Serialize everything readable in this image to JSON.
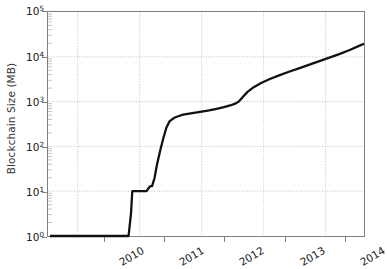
{
  "chart_data": {
    "type": "line",
    "title": "",
    "xlabel": "",
    "ylabel": "Blockchain Size (MB)",
    "yscale": "log",
    "ylim": [
      1,
      100000
    ],
    "xlim": [
      2009.52,
      2014.62
    ],
    "grid": true,
    "legend": false,
    "line_color": "#111111",
    "grid_color": "#bdbdbd",
    "axis_color": "#808080",
    "ytick_labels": [
      "10^0",
      "10^1",
      "10^2",
      "10^3",
      "10^4",
      "10^5"
    ],
    "ytick_bases": [
      "10",
      "10",
      "10",
      "10",
      "10",
      "10"
    ],
    "ytick_exponents": [
      "0",
      "1",
      "2",
      "3",
      "4",
      "5"
    ],
    "ytick_values": [
      1,
      10,
      100,
      1000,
      10000,
      100000
    ],
    "xtick_labels": [
      "2010",
      "2011",
      "2012",
      "2013",
      "2014"
    ],
    "xtick_values": [
      2010,
      2011,
      2012,
      2013,
      2014
    ],
    "series": [
      {
        "name": "Blockchain Size",
        "x": [
          2009.55,
          2010.82,
          2010.86,
          2010.88,
          2011.02,
          2011.08,
          2011.11,
          2011.14,
          2011.17,
          2011.2,
          2011.24,
          2011.28,
          2011.33,
          2011.38,
          2011.43,
          2011.48,
          2011.55,
          2011.62,
          2011.7,
          2011.8,
          2011.9,
          2012.0,
          2012.12,
          2012.24,
          2012.36,
          2012.46,
          2012.54,
          2012.6,
          2012.66,
          2012.74,
          2012.84,
          2012.96,
          2013.1,
          2013.26,
          2013.42,
          2013.58,
          2013.74,
          2013.9,
          2014.06,
          2014.22,
          2014.38,
          2014.54,
          2014.62
        ],
        "y": [
          1.0,
          1.0,
          3.2,
          10.0,
          10.0,
          10.0,
          10.0,
          11.5,
          13.0,
          13.0,
          20.0,
          40.0,
          80.0,
          150.0,
          260.0,
          360.0,
          430.0,
          470.0,
          510.0,
          540.0,
          570.0,
          600.0,
          640.0,
          690.0,
          750.0,
          820.0,
          900.0,
          1000.0,
          1250.0,
          1650.0,
          2100.0,
          2600.0,
          3200.0,
          3900.0,
          4700.0,
          5600.0,
          6700.0,
          8000.0,
          9600.0,
          11500.0,
          14000.0,
          17500.0,
          19500.0
        ]
      }
    ]
  },
  "axis": {
    "y_title": "Blockchain Size (MB)"
  }
}
